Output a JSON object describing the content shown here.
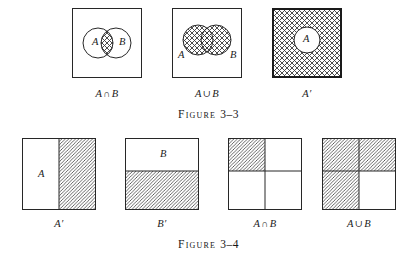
{
  "figures": [
    {
      "id": "figure-3-3",
      "title_word": "Figure",
      "title_number": "3–3",
      "panels": [
        {
          "id": "intersection",
          "caption_left": "A",
          "caption_op": "∩",
          "caption_right": "B",
          "label_a": "A",
          "label_b": "B",
          "shaded_region": "lens-overlap",
          "fill_style": "cross-hatch",
          "border": "thin"
        },
        {
          "id": "union",
          "caption_left": "A",
          "caption_op": "∪",
          "caption_right": "B",
          "label_a": "A",
          "label_b": "B",
          "shaded_region": "both-circles",
          "fill_style": "cross-hatch",
          "border": "thin"
        },
        {
          "id": "complement",
          "caption_left": "A",
          "caption_op": "",
          "caption_right": "′",
          "label_a": "A",
          "label_b": "",
          "shaded_region": "square-minus-circle",
          "fill_style": "cross-hatch",
          "border": "heavy"
        }
      ]
    },
    {
      "id": "figure-3-4",
      "title_word": "Figure",
      "title_number": "3–4",
      "panels": [
        {
          "id": "a-prime",
          "caption_left": "A",
          "caption_op": "",
          "caption_right": "′",
          "label_a": "A",
          "label_b": "",
          "shaded_region": "right-half",
          "fill_style": "diagonal-hatch",
          "border": "thin"
        },
        {
          "id": "b-prime",
          "caption_left": "B",
          "caption_op": "",
          "caption_right": "′",
          "label_a": "",
          "label_b": "B",
          "shaded_region": "bottom-half",
          "fill_style": "diagonal-hatch",
          "border": "thin"
        },
        {
          "id": "rect-intersection",
          "caption_left": "A",
          "caption_op": "∩",
          "caption_right": "B",
          "label_a": "",
          "label_b": "",
          "shaded_region": "top-left-quadrant",
          "fill_style": "diagonal-hatch",
          "border": "thin"
        },
        {
          "id": "rect-union",
          "caption_left": "A",
          "caption_op": "∪",
          "caption_right": "B",
          "label_a": "",
          "label_b": "",
          "shaded_region": "all-but-bottom-right-quadrant",
          "fill_style": "diagonal-hatch",
          "border": "thin"
        }
      ]
    }
  ],
  "colors": {
    "ink": "#1b1b1b",
    "line": "#272727",
    "hatch": "#3a3a3a",
    "page": "#ffffff"
  }
}
